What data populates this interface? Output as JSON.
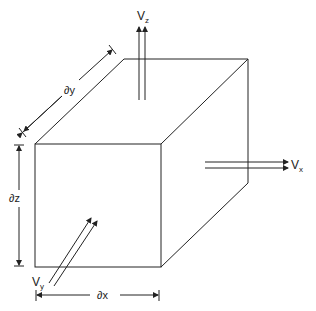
{
  "diagram": {
    "labels": {
      "vz": {
        "main": "V",
        "sub": "z"
      },
      "vx": {
        "main": "V",
        "sub": "x"
      },
      "vy": {
        "main": "V",
        "sub": "y"
      },
      "dy": "∂y",
      "dz": "∂z",
      "dx": "∂x"
    },
    "colors": {
      "line": "#222222",
      "background": "#ffffff"
    }
  }
}
